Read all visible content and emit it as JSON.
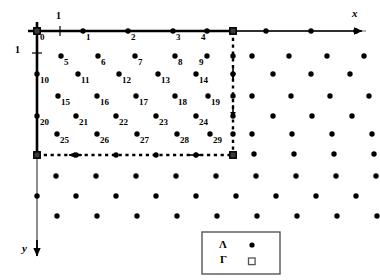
{
  "figure": {
    "kind": "lattice-diagram",
    "axes": {
      "x_label": "x",
      "y_label": "y",
      "x_tick_label": "1",
      "y_tick_label": "1",
      "x_direction": "right",
      "y_direction": "down"
    },
    "legend": {
      "rows": [
        {
          "symbol_name": "lambda-symbol",
          "symbol": "Λ",
          "marker": "filled-dot"
        },
        {
          "symbol_name": "gamma-symbol",
          "symbol": "Γ",
          "marker": "open-square"
        }
      ]
    },
    "colors": {
      "ink": "#000000",
      "axis_faded": "#8a8a8a",
      "legend_border": "#555555",
      "background": "#ffffff"
    },
    "numbered_points": [
      {
        "n": "0",
        "x": 37,
        "y": 31,
        "lx": 40,
        "ly": 33,
        "marker": "square"
      },
      {
        "n": "1",
        "x": 83,
        "y": 31,
        "lx": 86,
        "ly": 33,
        "marker": "dot"
      },
      {
        "n": "2",
        "x": 128,
        "y": 31,
        "lx": 131,
        "ly": 33,
        "marker": "dot"
      },
      {
        "n": "3",
        "x": 173,
        "y": 31,
        "lx": 176,
        "ly": 33,
        "marker": "dot"
      },
      {
        "n": "4",
        "x": 207,
        "y": 31,
        "lx": 201,
        "ly": 33,
        "marker": "dot"
      },
      {
        "n": "5",
        "x": 61,
        "y": 56,
        "lx": 64,
        "ly": 58,
        "marker": "dot"
      },
      {
        "n": "6",
        "x": 98,
        "y": 56,
        "lx": 101,
        "ly": 58,
        "marker": "dot"
      },
      {
        "n": "7",
        "x": 135,
        "y": 56,
        "lx": 138,
        "ly": 58,
        "marker": "dot"
      },
      {
        "n": "8",
        "x": 175,
        "y": 56,
        "lx": 178,
        "ly": 58,
        "marker": "dot"
      },
      {
        "n": "9",
        "x": 207,
        "y": 56,
        "lx": 199,
        "ly": 58,
        "marker": "dot"
      },
      {
        "n": "10",
        "x": 37,
        "y": 74,
        "lx": 40,
        "ly": 76,
        "marker": "dot"
      },
      {
        "n": "11",
        "x": 78,
        "y": 74,
        "lx": 81,
        "ly": 76,
        "marker": "dot"
      },
      {
        "n": "12",
        "x": 119,
        "y": 74,
        "lx": 122,
        "ly": 76,
        "marker": "dot"
      },
      {
        "n": "13",
        "x": 158,
        "y": 74,
        "lx": 161,
        "ly": 76,
        "marker": "dot"
      },
      {
        "n": "14",
        "x": 196,
        "y": 74,
        "lx": 199,
        "ly": 76,
        "marker": "dot"
      },
      {
        "n": "15",
        "x": 58,
        "y": 96,
        "lx": 61,
        "ly": 98,
        "marker": "dot"
      },
      {
        "n": "16",
        "x": 97,
        "y": 96,
        "lx": 100,
        "ly": 98,
        "marker": "dot"
      },
      {
        "n": "17",
        "x": 136,
        "y": 96,
        "lx": 139,
        "ly": 98,
        "marker": "dot"
      },
      {
        "n": "18",
        "x": 175,
        "y": 96,
        "lx": 178,
        "ly": 98,
        "marker": "dot"
      },
      {
        "n": "19",
        "x": 208,
        "y": 96,
        "lx": 211,
        "ly": 98,
        "marker": "dot"
      },
      {
        "n": "20",
        "x": 37,
        "y": 116,
        "lx": 40,
        "ly": 118,
        "marker": "dot"
      },
      {
        "n": "21",
        "x": 76,
        "y": 116,
        "lx": 79,
        "ly": 118,
        "marker": "dot"
      },
      {
        "n": "22",
        "x": 116,
        "y": 116,
        "lx": 119,
        "ly": 118,
        "marker": "dot"
      },
      {
        "n": "23",
        "x": 156,
        "y": 116,
        "lx": 159,
        "ly": 118,
        "marker": "dot"
      },
      {
        "n": "24",
        "x": 196,
        "y": 116,
        "lx": 199,
        "ly": 118,
        "marker": "dot"
      },
      {
        "n": "25",
        "x": 57,
        "y": 134,
        "lx": 60,
        "ly": 136,
        "marker": "dot"
      },
      {
        "n": "26",
        "x": 97,
        "y": 134,
        "lx": 100,
        "ly": 136,
        "marker": "dot"
      },
      {
        "n": "27",
        "x": 137,
        "y": 134,
        "lx": 140,
        "ly": 136,
        "marker": "dot"
      },
      {
        "n": "28",
        "x": 177,
        "y": 134,
        "lx": 180,
        "ly": 136,
        "marker": "dot"
      },
      {
        "n": "29",
        "x": 210,
        "y": 134,
        "lx": 213,
        "ly": 136,
        "marker": "dot"
      }
    ],
    "corner_squares": [
      {
        "name": "origin-corner",
        "x": 37,
        "y": 31
      },
      {
        "name": "top-right-corner",
        "x": 233,
        "y": 31
      },
      {
        "name": "bottom-left-corner",
        "x": 37,
        "y": 155
      },
      {
        "name": "bottom-right-corner",
        "x": 233,
        "y": 155
      }
    ],
    "outside_dots": [
      {
        "x": 266,
        "y": 31
      },
      {
        "x": 311,
        "y": 31
      },
      {
        "x": 356,
        "y": 31
      },
      {
        "x": 252,
        "y": 56
      },
      {
        "x": 289,
        "y": 56
      },
      {
        "x": 327,
        "y": 56
      },
      {
        "x": 364,
        "y": 56
      },
      {
        "x": 273,
        "y": 74
      },
      {
        "x": 311,
        "y": 74
      },
      {
        "x": 350,
        "y": 74
      },
      {
        "x": 252,
        "y": 96
      },
      {
        "x": 291,
        "y": 96
      },
      {
        "x": 330,
        "y": 96
      },
      {
        "x": 369,
        "y": 96
      },
      {
        "x": 273,
        "y": 116
      },
      {
        "x": 312,
        "y": 116
      },
      {
        "x": 352,
        "y": 116
      },
      {
        "x": 252,
        "y": 134
      },
      {
        "x": 292,
        "y": 134
      },
      {
        "x": 332,
        "y": 134
      },
      {
        "x": 372,
        "y": 134
      },
      {
        "x": 56,
        "y": 176
      },
      {
        "x": 96,
        "y": 176
      },
      {
        "x": 136,
        "y": 176
      },
      {
        "x": 176,
        "y": 176
      },
      {
        "x": 216,
        "y": 176
      },
      {
        "x": 256,
        "y": 176
      },
      {
        "x": 296,
        "y": 176
      },
      {
        "x": 336,
        "y": 176
      },
      {
        "x": 376,
        "y": 176
      },
      {
        "x": 37,
        "y": 196
      },
      {
        "x": 76,
        "y": 196
      },
      {
        "x": 116,
        "y": 196
      },
      {
        "x": 156,
        "y": 196
      },
      {
        "x": 196,
        "y": 196
      },
      {
        "x": 236,
        "y": 196
      },
      {
        "x": 276,
        "y": 196
      },
      {
        "x": 316,
        "y": 196
      },
      {
        "x": 356,
        "y": 196
      },
      {
        "x": 57,
        "y": 216
      },
      {
        "x": 97,
        "y": 216
      },
      {
        "x": 137,
        "y": 216
      },
      {
        "x": 177,
        "y": 216
      },
      {
        "x": 217,
        "y": 216
      },
      {
        "x": 257,
        "y": 216
      },
      {
        "x": 297,
        "y": 216
      },
      {
        "x": 337,
        "y": 216
      },
      {
        "x": 377,
        "y": 216
      },
      {
        "x": 254,
        "y": 154
      },
      {
        "x": 294,
        "y": 154
      },
      {
        "x": 334,
        "y": 154
      },
      {
        "x": 374,
        "y": 154
      }
    ],
    "axis_dots_x": [
      {
        "x": 266,
        "y": 31
      },
      {
        "x": 311,
        "y": 31
      },
      {
        "x": 356,
        "y": 31
      }
    ],
    "axis_dots_y": [
      {
        "x": 37,
        "y": 196
      }
    ],
    "dashed_edge_dots": [
      {
        "x": 233,
        "y": 56
      },
      {
        "x": 233,
        "y": 74
      },
      {
        "x": 233,
        "y": 96
      },
      {
        "x": 233,
        "y": 116
      },
      {
        "x": 233,
        "y": 134
      },
      {
        "x": 76,
        "y": 155
      },
      {
        "x": 116,
        "y": 155
      },
      {
        "x": 156,
        "y": 155
      },
      {
        "x": 196,
        "y": 155
      }
    ]
  }
}
